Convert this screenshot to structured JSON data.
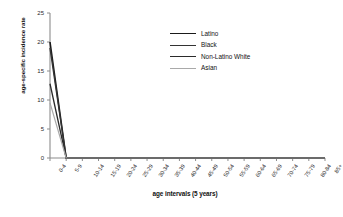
{
  "chart_data": {
    "type": "line",
    "title": "",
    "xlabel": "age intervals (5 years)",
    "ylabel": "age-specific incidence rate",
    "categories": [
      "0-4",
      "5-9",
      "10-14",
      "15-19",
      "20-24",
      "25-29",
      "30-34",
      "35-39",
      "40-44",
      "45-49",
      "50-54",
      "55-59",
      "60-64",
      "65-69",
      "70-74",
      "75-79",
      "80-84",
      "85+"
    ],
    "yticks": [
      0,
      5,
      10,
      15,
      20,
      25
    ],
    "ylim": [
      0,
      25
    ],
    "grid": false,
    "legend_position": "upper-right",
    "series": [
      {
        "name": "Latino",
        "color": "#1a1a1a",
        "width": 1.6,
        "values": [
          20.0,
          0,
          0,
          0,
          0,
          0,
          0,
          0,
          0,
          0,
          0,
          0,
          0,
          0,
          0,
          0,
          0,
          0
        ]
      },
      {
        "name": "Black",
        "color": "#333333",
        "width": 1.4,
        "values": [
          19.0,
          0,
          0,
          0,
          0,
          0,
          0,
          0,
          0,
          0,
          0,
          0,
          0,
          0,
          0,
          0,
          0,
          0
        ]
      },
      {
        "name": "Non-Latino White",
        "color": "#2b2b2b",
        "width": 1.3,
        "values": [
          12.8,
          0,
          0,
          0,
          0,
          0,
          0,
          0,
          0,
          0,
          0,
          0,
          0,
          0,
          0,
          0,
          0,
          0
        ]
      },
      {
        "name": "Asian",
        "color": "#a9a9a9",
        "width": 1.2,
        "values": [
          9.5,
          0,
          0,
          0,
          0,
          0,
          0,
          0,
          0,
          0,
          0,
          0,
          0,
          0,
          0,
          0,
          0,
          0
        ]
      }
    ]
  },
  "axes": {
    "axis_color": "#8c8c8c",
    "tick_color": "#8c8c8c",
    "background": "#ffffff"
  }
}
